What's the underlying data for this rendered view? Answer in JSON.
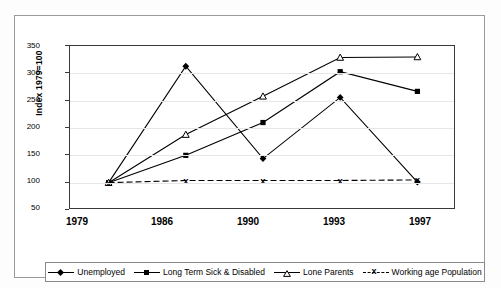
{
  "chart_data": {
    "type": "line",
    "title": "",
    "xlabel": "",
    "ylabel": "Index  1979=100",
    "categories": [
      "1979",
      "1986",
      "1990",
      "1993",
      "1997"
    ],
    "ylim": [
      50,
      350
    ],
    "yticks": [
      50,
      100,
      150,
      200,
      250,
      300,
      350
    ],
    "grid": true,
    "legend_position": "bottom",
    "series": [
      {
        "name": "Unemployed",
        "marker": "filled-diamond",
        "line": "solid",
        "values": [
          100,
          313,
          144,
          256,
          101
        ]
      },
      {
        "name": "Long Term Sick & Disabled",
        "marker": "filled-square",
        "line": "solid",
        "values": [
          100,
          150,
          210,
          303,
          267
        ]
      },
      {
        "name": "Lone Parents",
        "marker": "open-triangle",
        "line": "solid",
        "values": [
          100,
          188,
          258,
          329,
          330
        ]
      },
      {
        "name": "Working age Population",
        "marker": "x",
        "line": "dashed",
        "values": [
          100,
          104,
          104,
          104,
          105
        ]
      }
    ]
  },
  "axis": {
    "y_title": "Index  1979=100",
    "y_tick_labels": [
      "350",
      "300",
      "250",
      "200",
      "150",
      "100",
      "50"
    ],
    "x_tick_labels": [
      "1979",
      "1986",
      "1990",
      "1993",
      "1997"
    ]
  },
  "legend": {
    "items": [
      {
        "label": "Unemployed",
        "marker": "filled-diamond"
      },
      {
        "label": "Long Term Sick & Disabled",
        "marker": "filled-square"
      },
      {
        "label": "Lone Parents",
        "marker": "open-triangle"
      },
      {
        "label": "Working age Population",
        "marker": "x"
      }
    ]
  },
  "colors": {
    "series_line": "#000000",
    "plot_border": "#3a3a3a",
    "grid": "#e6e6ea",
    "background": "#ffffff"
  }
}
